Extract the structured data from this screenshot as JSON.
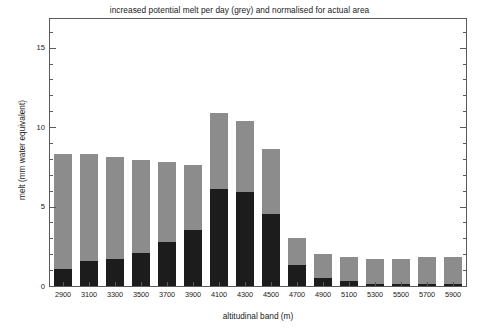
{
  "chart_data": {
    "type": "bar",
    "title": "increased potential melt per day (grey) and normalised for actual area",
    "xlabel": "altitudinal band (m)",
    "ylabel": "melt (mm water equivalent)",
    "categories": [
      "2900",
      "3100",
      "3300",
      "3500",
      "3700",
      "3900",
      "4100",
      "4300",
      "4500",
      "4700",
      "4900",
      "5100",
      "5300",
      "5500",
      "5700",
      "5900"
    ],
    "series": [
      {
        "name": "increased potential melt per day (grey)",
        "color": "#8c8c8c",
        "values": [
          8.3,
          8.3,
          8.1,
          7.9,
          7.8,
          7.6,
          10.9,
          10.4,
          8.6,
          3.0,
          2.0,
          1.8,
          1.7,
          1.7,
          1.8,
          1.8
        ]
      },
      {
        "name": "normalised for actual area (black)",
        "color": "#1c1c1c",
        "values": [
          1.1,
          1.6,
          1.7,
          2.1,
          2.8,
          3.5,
          6.1,
          5.9,
          4.5,
          1.3,
          0.5,
          0.3,
          0.15,
          0.1,
          0.1,
          0.1
        ]
      }
    ],
    "stacked": true,
    "ylim": [
      0,
      16.8
    ],
    "yticks": [
      0,
      5,
      10,
      15
    ],
    "ytick_labels": [
      "0",
      "5",
      "10",
      "15"
    ],
    "yminor_step": 1,
    "grid": false,
    "legend": "none"
  },
  "axes": {
    "y_label": "melt (mm water equivalent)",
    "x_label": "altitudinal band (m)",
    "y_tick_labels": [
      "0",
      "5",
      "10",
      "15"
    ]
  }
}
